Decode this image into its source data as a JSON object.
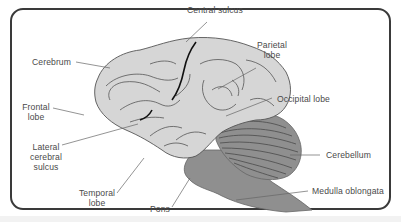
{
  "diagram": {
    "colors": {
      "cerebrum_fill": "#d6d6d6",
      "hindbrain_fill": "#8f8f8f",
      "outline": "#555555",
      "central_sulcus": "#111111",
      "frame_border": "#3a3a3a",
      "label_text": "#4a4a4a"
    },
    "labels": {
      "central_sulcus": "Central sulcus",
      "cerebrum": "Cerebrum",
      "parietal_lobe_1": "Parietal",
      "parietal_lobe_2": "lobe",
      "occipital_lobe": "Occipital lobe",
      "frontal_lobe_1": "Frontal",
      "frontal_lobe_2": "lobe",
      "lateral_sulcus_1": "Lateral",
      "lateral_sulcus_2": "cerebral",
      "lateral_sulcus_3": "sulcus",
      "cerebellum": "Cerebellum",
      "temporal_lobe_1": "Temporal",
      "temporal_lobe_2": "lobe",
      "pons": "Pons",
      "medulla_oblongata": "Medulla oblongata"
    }
  }
}
